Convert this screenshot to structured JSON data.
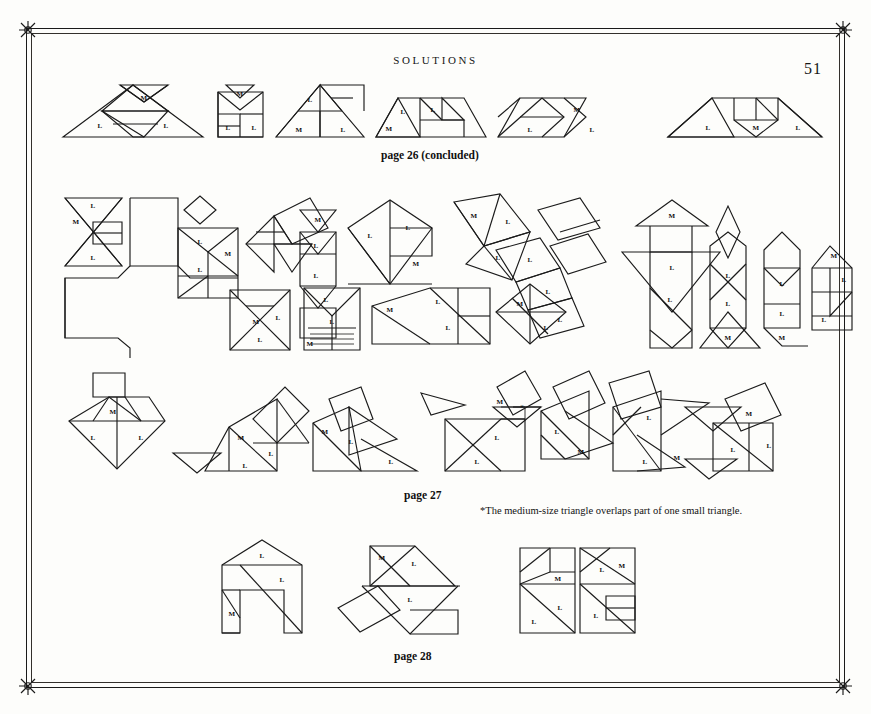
{
  "page": {
    "running_head": "SOLUTIONS",
    "folio": "51",
    "background_color": "#fdfdfb",
    "ink_color": "#1b1b1b"
  },
  "captions": [
    {
      "id": "cap-26",
      "text": "page 26 (concluded)",
      "x": 381,
      "y": 149
    },
    {
      "id": "cap-27",
      "text": "page 27",
      "x": 404,
      "y": 489
    },
    {
      "id": "cap-28",
      "text": "page 28",
      "x": 394,
      "y": 650
    }
  ],
  "footnote": {
    "marker": "*",
    "text": "*The medium-size triangle overlaps part of one small triangle.",
    "x": 480,
    "y": 505
  },
  "piece_labels": {
    "large": "L",
    "medium": "M",
    "overlap_marker": "*"
  },
  "rows": [
    {
      "id": "row-page26",
      "caption_ref": "cap-26",
      "figure_count": 6,
      "labels_used": [
        "L",
        "M"
      ]
    },
    {
      "id": "row-page27-upper",
      "caption_ref": "cap-27",
      "figure_count": 16,
      "labels_used": [
        "L",
        "M"
      ]
    },
    {
      "id": "row-page27-lower",
      "caption_ref": "cap-27",
      "figure_count": 7,
      "labels_used": [
        "L",
        "M",
        "*"
      ]
    },
    {
      "id": "row-page28",
      "caption_ref": "cap-28",
      "figure_count": 3,
      "labels_used": [
        "L",
        "M"
      ]
    }
  ]
}
